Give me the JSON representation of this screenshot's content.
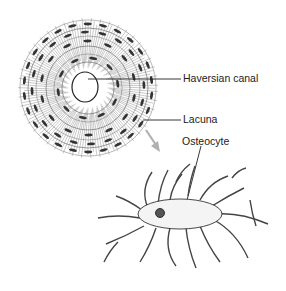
{
  "diagram": {
    "labels": {
      "haversian_canal": "Haversian canal",
      "lacuna": "Lacuna",
      "osteocyte": "Osteocyte"
    },
    "colors": {
      "ink": "#222222",
      "arrow": "#b0b0b0",
      "background": "#ffffff"
    }
  }
}
